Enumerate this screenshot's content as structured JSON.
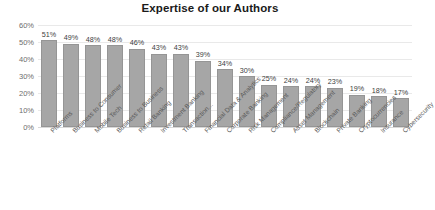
{
  "chart_data": {
    "type": "bar",
    "title": "Expertise of our Authors",
    "xlabel": "",
    "ylabel": "",
    "ylim": [
      0,
      60
    ],
    "ytick_labels": [
      "60%",
      "50%",
      "40%",
      "30%",
      "20%",
      "10%",
      "0%"
    ],
    "yticks": [
      60,
      50,
      40,
      30,
      20,
      10,
      0
    ],
    "grid": true,
    "legend": "none",
    "value_suffix": "%",
    "bar_color": "#a6a6a6",
    "bar_border_color": "#959595",
    "categories": [
      "Platforms",
      "Business to Consumer",
      "Mobile Tech",
      "Business to Business",
      "Retail Banking",
      "Investment Banking",
      "Transaction...",
      "Financial Data & Analytics",
      "Corporate Banking",
      "Risk Management",
      "Compliance/Regulatory",
      "Asset Management",
      "Blockchain",
      "Private Banking",
      "Cryptocurrencies",
      "Insurance",
      "Cybersecurity"
    ],
    "values": [
      51,
      49,
      48,
      48,
      46,
      43,
      43,
      39,
      34,
      30,
      25,
      24,
      24,
      23,
      19,
      18,
      17
    ],
    "data_labels": [
      "51%",
      "49%",
      "48%",
      "48%",
      "46%",
      "43%",
      "43%",
      "39%",
      "34%",
      "30%",
      "25%",
      "24%",
      "24%",
      "23%",
      "19%",
      "18%",
      "17%"
    ]
  }
}
